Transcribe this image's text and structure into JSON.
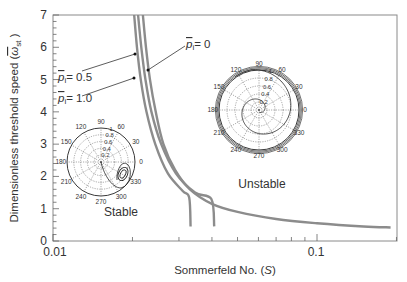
{
  "chart_data": {
    "type": "line",
    "title": "",
    "xlabel": "Sommerfeld No. (S)",
    "ylabel": "Dimensionless threshold speed (ω̄st )",
    "xscale": "log",
    "xlim": [
      0.01,
      0.2
    ],
    "ylim": [
      0,
      7
    ],
    "xticks": [
      {
        "value": 0.01,
        "label": "0.01"
      },
      {
        "value": 0.1,
        "label": "0.1"
      }
    ],
    "yticks": [
      0,
      1,
      2,
      3,
      4,
      5,
      6,
      7
    ],
    "grid": false,
    "series": [
      {
        "name": "p̄i = 0",
        "label": "p̄i = 0",
        "points": [
          [
            0.0219,
            7.0
          ],
          [
            0.0225,
            6.0
          ],
          [
            0.0233,
            5.0
          ],
          [
            0.0245,
            4.0
          ],
          [
            0.0262,
            3.0
          ],
          [
            0.029,
            2.2
          ],
          [
            0.033,
            1.6
          ],
          [
            0.04,
            1.15
          ],
          [
            0.05,
            0.9
          ],
          [
            0.07,
            0.68
          ],
          [
            0.1,
            0.55
          ],
          [
            0.15,
            0.45
          ],
          [
            0.19,
            0.42
          ]
        ]
      },
      {
        "name": "p̄i = 0.5",
        "label": "p̄i = 0.5",
        "points": [
          [
            0.0203,
            7.0
          ],
          [
            0.0208,
            6.0
          ],
          [
            0.0215,
            5.0
          ],
          [
            0.0226,
            4.0
          ],
          [
            0.0244,
            3.0
          ],
          [
            0.0272,
            2.1
          ],
          [
            0.031,
            1.55
          ],
          [
            0.0328,
            1.35
          ],
          [
            0.0332,
            0.45
          ]
        ]
      },
      {
        "name": "p̄i = 1.0",
        "label": "p̄i = 1.0",
        "points": [
          [
            0.021,
            7.0
          ],
          [
            0.0216,
            6.0
          ],
          [
            0.0224,
            5.0
          ],
          [
            0.0236,
            4.0
          ],
          [
            0.0257,
            3.0
          ],
          [
            0.0292,
            2.1
          ],
          [
            0.0345,
            1.5
          ],
          [
            0.0398,
            1.3
          ],
          [
            0.0408,
            0.45
          ]
        ]
      }
    ],
    "annotations": [
      {
        "text": "p̄i = 0.5",
        "target_series": "p̄i = 0.5"
      },
      {
        "text": "p̄i = 1.0",
        "target_series": "p̄i = 1.0"
      },
      {
        "text": "p̄i = 0",
        "target_series": "p̄i = 0"
      },
      {
        "text": "Stable",
        "region": "lower-left"
      },
      {
        "text": "Unstable",
        "region": "upper-right"
      }
    ],
    "insets": [
      {
        "name": "stable-orbit-polar",
        "type": "polar",
        "label": "Stable",
        "angle_labels": [
          "0",
          "30",
          "60",
          "90",
          "120",
          "150",
          "180",
          "210",
          "240",
          "270",
          "300",
          "330"
        ],
        "radial_labels": [
          "0.2",
          "0.4",
          "0.6",
          "0.8",
          "1"
        ],
        "description": "Orbit converging to a small closed loop near 315°, radius ~0.6"
      },
      {
        "name": "unstable-orbit-polar",
        "type": "polar",
        "label": "Unstable",
        "angle_labels": [
          "0",
          "30",
          "60",
          "90",
          "120",
          "150",
          "180",
          "210",
          "240",
          "270",
          "300",
          "330"
        ],
        "radial_labels": [
          "0.2",
          "0.4",
          "0.6",
          "0.8",
          "1"
        ],
        "description": "Orbit spiraling outward to the bearing clearance circle (radius ~1)"
      }
    ]
  },
  "labels": {
    "xlabel": "Sommerfeld No. (",
    "xlabel_var": "S",
    "xlabel_end": ")",
    "ylabel_main": "Dimensionless threshold speed (",
    "ylabel_var": "ω",
    "ylabel_sub": "st",
    "ylabel_end": " )",
    "ann_p05": "= 0.5",
    "ann_p10": "= 1.0",
    "ann_p0": "= 0",
    "p_symbol": "p",
    "p_sub": "i",
    "stable": "Stable",
    "unstable": "Unstable",
    "x_tick_001": "0.01",
    "x_tick_01": "0.1",
    "y0": "0",
    "y1": "1",
    "y2": "2",
    "y3": "3",
    "y4": "4",
    "y5": "5",
    "y6": "6",
    "y7": "7"
  },
  "polar_labels": {
    "a0": "0",
    "a30": "30",
    "a60": "60",
    "a90": "90",
    "a120": "120",
    "a150": "150",
    "a180": "180",
    "a210": "210",
    "a240": "240",
    "a270": "270",
    "a300": "300",
    "a330": "330",
    "r02": "0.2",
    "r04": "0.4",
    "r06": "0.6",
    "r08": "0.8",
    "r1": "1"
  }
}
